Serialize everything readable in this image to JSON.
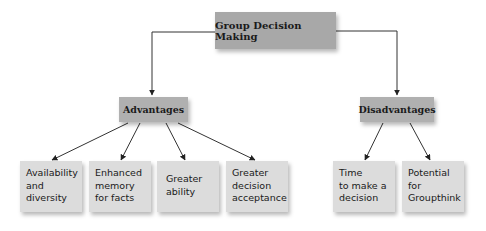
{
  "diagram": {
    "root": {
      "label": "Group Decision Making"
    },
    "branches": [
      {
        "label": "Advantages",
        "children": [
          {
            "label": "Availability\nand\ndiversity"
          },
          {
            "label": "Enhanced\nmemory\nfor facts"
          },
          {
            "label": "Greater\nability"
          },
          {
            "label": "Greater\ndecision\nacceptance"
          }
        ]
      },
      {
        "label": "Disadvantages",
        "children": [
          {
            "label": "Time\nto make a\ndecision"
          },
          {
            "label": "Potential\nfor\nGroupthink"
          }
        ]
      }
    ],
    "colors": {
      "root_fill": "#a8a8a8",
      "branch_fill": "#b0b0b0",
      "leaf_fill": "#dcdcdc",
      "line": "#333333"
    }
  }
}
